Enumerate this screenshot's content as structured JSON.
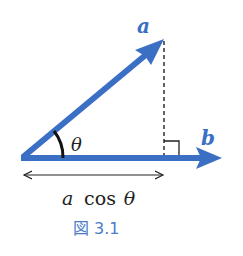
{
  "diagram": {
    "vector_a_label": "a",
    "vector_b_label": "b",
    "angle_label": "θ",
    "projection_label_var": "a",
    "projection_label_func": "cos",
    "projection_label_angle": "θ",
    "caption": "図 3.1"
  },
  "colors": {
    "vector": "#3a6fc4",
    "label": "#3a6fc4",
    "caption": "#4a7cc9",
    "black": "#222222"
  }
}
